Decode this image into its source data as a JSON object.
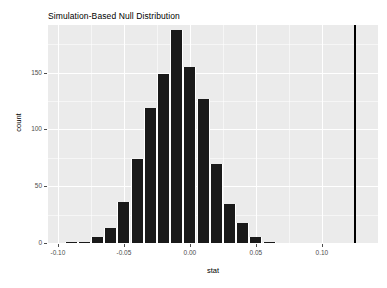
{
  "chart_data": {
    "type": "bar",
    "title": "Simulation-Based Null Distribution",
    "xlabel": "stat",
    "ylabel": "count",
    "xlim": [
      -0.1075,
      0.1425
    ],
    "ylim": [
      0,
      192
    ],
    "grid": true,
    "legend": null,
    "bin_width": 0.01,
    "x_ticks": [
      {
        "value": -0.1,
        "label": "-0.10"
      },
      {
        "value": -0.05,
        "label": "-0.05"
      },
      {
        "value": 0.0,
        "label": "0.00"
      },
      {
        "value": 0.05,
        "label": "0.05"
      },
      {
        "value": 0.1,
        "label": "0.10"
      }
    ],
    "y_ticks": [
      {
        "value": 0,
        "label": "0"
      },
      {
        "value": 50,
        "label": "50"
      },
      {
        "value": 100,
        "label": "100"
      },
      {
        "value": 150,
        "label": "150"
      }
    ],
    "bins": [
      {
        "x_left": -0.095,
        "x_right": -0.085,
        "center": -0.09,
        "count": 1
      },
      {
        "x_left": -0.085,
        "x_right": -0.075,
        "center": -0.08,
        "count": 1
      },
      {
        "x_left": -0.075,
        "x_right": -0.065,
        "center": -0.07,
        "count": 5
      },
      {
        "x_left": -0.065,
        "x_right": -0.055,
        "center": -0.06,
        "count": 13
      },
      {
        "x_left": -0.055,
        "x_right": -0.045,
        "center": -0.05,
        "count": 36
      },
      {
        "x_left": -0.045,
        "x_right": -0.035,
        "center": -0.04,
        "count": 74
      },
      {
        "x_left": -0.035,
        "x_right": -0.025,
        "center": -0.03,
        "count": 119
      },
      {
        "x_left": -0.025,
        "x_right": -0.015,
        "center": -0.02,
        "count": 149
      },
      {
        "x_left": -0.015,
        "x_right": -0.005,
        "center": -0.01,
        "count": 188
      },
      {
        "x_left": -0.005,
        "x_right": 0.005,
        "center": 0.0,
        "count": 155
      },
      {
        "x_left": 0.005,
        "x_right": 0.015,
        "center": 0.01,
        "count": 127
      },
      {
        "x_left": 0.015,
        "x_right": 0.025,
        "center": 0.02,
        "count": 70
      },
      {
        "x_left": 0.025,
        "x_right": 0.035,
        "center": 0.03,
        "count": 34
      },
      {
        "x_left": 0.035,
        "x_right": 0.045,
        "center": 0.04,
        "count": 18
      },
      {
        "x_left": 0.045,
        "x_right": 0.055,
        "center": 0.05,
        "count": 5
      },
      {
        "x_left": 0.055,
        "x_right": 0.065,
        "center": 0.06,
        "count": 1
      }
    ],
    "annotations": [
      {
        "type": "vertical-line",
        "name": "observed-statistic-line",
        "x": 0.125,
        "color": "#000000"
      }
    ],
    "colors": {
      "bar_fill": "#1a1a1a",
      "panel_background": "#ebebeb",
      "grid": "#ffffff",
      "text": "#000000",
      "tick_text": "#4d4d4d"
    }
  }
}
